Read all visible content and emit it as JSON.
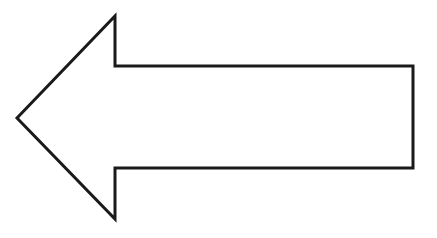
{
  "figure": {
    "shape": "left-arrow-outline",
    "stroke_color": "#1a1a1a",
    "fill_color": "#ffffff",
    "background": "#ffffff",
    "stroke_width": 3,
    "points": "17,118 115,16 115,66 413,66 413,168 115,168 115,219"
  }
}
